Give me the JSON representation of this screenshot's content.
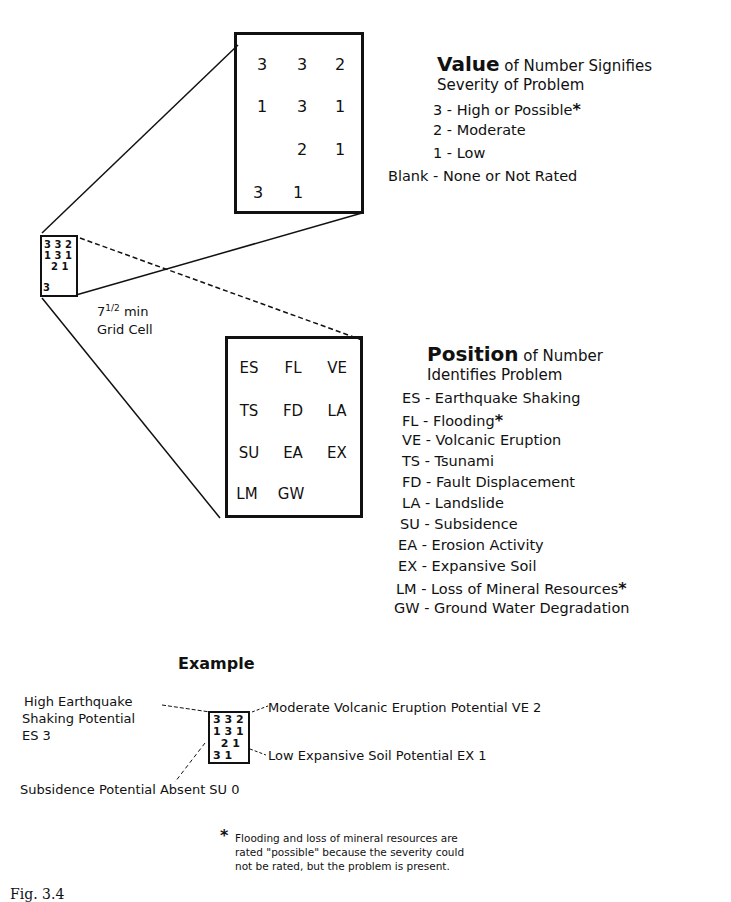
{
  "value_panel": {
    "grid": [
      [
        "3",
        "3",
        "2"
      ],
      [
        "1",
        "3",
        "1"
      ],
      [
        "",
        "2",
        "1"
      ],
      [
        "3",
        "1",
        ""
      ]
    ],
    "title_bold": "Value",
    "title_rest": " of Number Signifies",
    "title_line2": "Severity of Problem",
    "legend": [
      {
        "key": "3",
        "desc": "High or Possible",
        "asterisk": "*"
      },
      {
        "key": "2",
        "desc": "Moderate",
        "asterisk": ""
      },
      {
        "key": "1",
        "desc": "Low",
        "asterisk": ""
      },
      {
        "key": "Blank",
        "desc": "None or Not Rated",
        "asterisk": ""
      }
    ]
  },
  "small_cell": {
    "rows": [
      "3 3 2",
      "1 3 1",
      "  2 1",
      "3"
    ],
    "label_line1": "7",
    "label_sup": "1/2",
    "label_unit": " min",
    "label_line2": "Grid Cell"
  },
  "position_panel": {
    "grid": [
      [
        "ES",
        "FL",
        "VE"
      ],
      [
        "TS",
        "FD",
        "LA"
      ],
      [
        "SU",
        "EA",
        "EX"
      ],
      [
        "LM",
        "GW",
        ""
      ]
    ],
    "title_bold": "Position",
    "title_rest": " of Number",
    "title_line2": "Identifies Problem",
    "legend": [
      {
        "key": "ES",
        "desc": "Earthquake Shaking",
        "asterisk": ""
      },
      {
        "key": "FL",
        "desc": "Flooding",
        "asterisk": "*"
      },
      {
        "key": "VE",
        "desc": "Volcanic Eruption",
        "asterisk": ""
      },
      {
        "key": "TS",
        "desc": "Tsunami",
        "asterisk": ""
      },
      {
        "key": "FD",
        "desc": "Fault Displacement",
        "asterisk": ""
      },
      {
        "key": "LA",
        "desc": "Landslide",
        "asterisk": ""
      },
      {
        "key": "SU",
        "desc": "Subsidence",
        "asterisk": ""
      },
      {
        "key": "EA",
        "desc": "Erosion Activity",
        "asterisk": ""
      },
      {
        "key": "EX",
        "desc": "Expansive Soil",
        "asterisk": ""
      },
      {
        "key": "LM",
        "desc": "Loss of Mineral Resources",
        "asterisk": "*"
      },
      {
        "key": "GW",
        "desc": "Ground Water Degradation",
        "asterisk": ""
      }
    ]
  },
  "example": {
    "title": "Example",
    "rows": [
      "3 3 2",
      "1 3 1",
      "  2 1",
      "3 1"
    ],
    "callouts": {
      "es_line1": "High Earthquake",
      "es_line2": "Shaking Potential",
      "es_line3": "ES 3",
      "ve": "Moderate Volcanic Eruption Potential VE 2",
      "ex": "Low Expansive Soil Potential EX 1",
      "su": "Subsidence Potential Absent SU 0"
    }
  },
  "footnote": {
    "asterisk": "*",
    "line1": "Flooding and loss of mineral resources are",
    "line2": "rated \"possible\" because the severity could",
    "line3": "not be rated, but the problem is present."
  },
  "caption": "Fig. 3.4"
}
